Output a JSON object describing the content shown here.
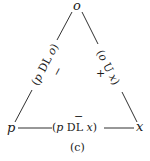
{
  "diagram": {
    "type": "triangle",
    "nodes": {
      "top": "o",
      "left": "p",
      "right": "x"
    },
    "edges": {
      "left": {
        "label_open": "(",
        "var1": "p",
        "rel": " DL ",
        "var2": "o",
        "label_close": ")",
        "sign": "−"
      },
      "right": {
        "label_open": "(",
        "var1": "o",
        "rel": " U ",
        "var2": "x",
        "label_close": ")",
        "sign": "+"
      },
      "bottom": {
        "label_open": "(",
        "var1": "p",
        "rel": " DL ",
        "var2": "x",
        "label_close": ")",
        "sign": "−"
      }
    },
    "caption": "(c)",
    "colors": {
      "ink": "#1a1a1a",
      "background": "#ffffff"
    }
  }
}
